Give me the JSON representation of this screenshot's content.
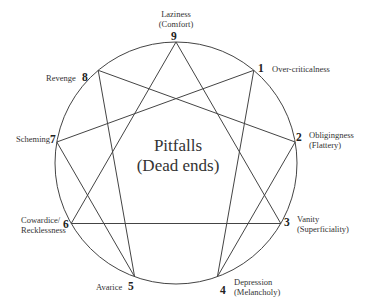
{
  "title": {
    "line1": "Pitfalls",
    "line2": "(Dead ends)"
  },
  "points": [
    {
      "number": "1",
      "label": "Over-criticalness",
      "sublabel": ""
    },
    {
      "number": "2",
      "label": "Obligingness",
      "sublabel": "(Flattery)"
    },
    {
      "number": "3",
      "label": "Vanity",
      "sublabel": "(Superficiality)"
    },
    {
      "number": "4",
      "label": "Depression",
      "sublabel": "(Melancholy)"
    },
    {
      "number": "5",
      "label": "Avarice",
      "sublabel": ""
    },
    {
      "number": "6",
      "label": "Cowardice/",
      "sublabel": "Recklessness"
    },
    {
      "number": "7",
      "label": "Scheming",
      "sublabel": ""
    },
    {
      "number": "8",
      "label": "Revenge",
      "sublabel": ""
    },
    {
      "number": "9",
      "label": "Laziness",
      "sublabel": "(Comfort)"
    }
  ],
  "geometry": {
    "circle": {
      "cx": 176,
      "cy": 163,
      "r": 121
    },
    "triangle": [
      "9",
      "3",
      "6"
    ],
    "hexad": [
      "1",
      "4",
      "2",
      "8",
      "5",
      "7"
    ]
  },
  "colors": {
    "stroke": "#444444",
    "text": "#333333"
  }
}
